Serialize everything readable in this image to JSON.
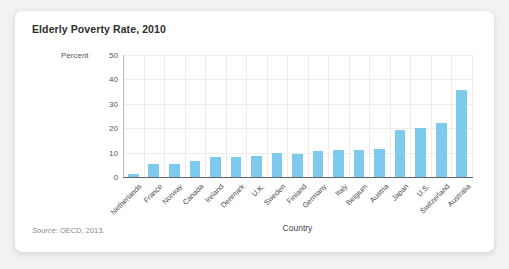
{
  "card": {
    "title": "Elderly Poverty Rate, 2010",
    "source_word": "Source",
    "source_rest": ": OECD, 2013."
  },
  "colors": {
    "bar": "#7ecaec",
    "grid": "#ececec",
    "axis": "#63646a",
    "card_background": "#ffffff",
    "page_background": "#f2f2f2",
    "title_text": "#2e2e2e"
  },
  "chart_data": {
    "type": "bar",
    "title": "Elderly Poverty Rate, 2010",
    "subtitle": "",
    "xlabel": "Country",
    "ylabel": "Percent",
    "ylim": [
      0,
      50
    ],
    "yticks": [
      0,
      10,
      20,
      30,
      40,
      50
    ],
    "ytick_labels": [
      "0",
      "10",
      "20",
      "30",
      "40",
      "50"
    ],
    "grid": true,
    "legend": "none",
    "categories": [
      "Netherlands",
      "France",
      "Norway",
      "Canada",
      "Ireland",
      "Denmark",
      "U.K.",
      "Sweden",
      "Finland",
      "Germany",
      "Italy",
      "Belgium",
      "Austria",
      "Japan",
      "U.S.",
      "Switzerland",
      "Australia"
    ],
    "values": [
      1.4,
      5.3,
      5.3,
      6.7,
      8.0,
      8.0,
      8.6,
      9.7,
      9.6,
      10.5,
      11.0,
      11.0,
      11.5,
      19.4,
      19.9,
      22.0,
      35.5
    ],
    "series": [
      {
        "name": "Elderly poverty rate",
        "values": [
          1.4,
          5.3,
          5.3,
          6.7,
          8.0,
          8.0,
          8.6,
          9.7,
          9.6,
          10.5,
          11.0,
          11.0,
          11.5,
          19.4,
          19.9,
          22.0,
          35.5
        ]
      }
    ]
  }
}
